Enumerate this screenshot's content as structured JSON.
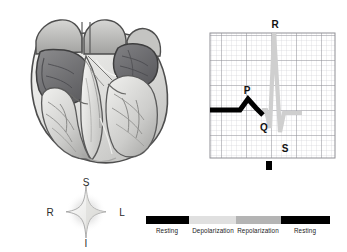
{
  "figure": {
    "background_color": "#ffffff"
  },
  "heart_illustration": {
    "name": "heart-cross-section",
    "description": "Grayscale anatomical cutaway of the heart showing atria, ventricles and trabeculae",
    "palette": {
      "outline": "#4a4a4a",
      "muscle_light": "#e8e8e6",
      "muscle_mid": "#c9c9c7",
      "muscle_dark": "#9a9a98",
      "chamber_dark": "#6f6f70",
      "chamber_darker": "#5a5a5c",
      "highlight": "#f6f6f4"
    }
  },
  "ecg": {
    "grid": {
      "minor_color": "#d2d2d6",
      "major_color": "#8d8d93",
      "minor_step_px": 5,
      "major_every": 5,
      "columns": 25,
      "rows": 25
    },
    "trace": {
      "drawn_color": "#000000",
      "pending_color": "#cfcfcf",
      "drawn_phase": "P wave",
      "pending_phase": "QRS complex"
    },
    "labels": [
      {
        "text": "P",
        "name": "p-wave-label",
        "x": 243,
        "y": 93
      },
      {
        "text": "R",
        "name": "r-wave-label",
        "x": 276,
        "y": 24
      },
      {
        "text": "Q",
        "name": "q-wave-label",
        "x": 263,
        "y": 127
      },
      {
        "text": "S",
        "name": "s-wave-label",
        "x": 285,
        "y": 148
      }
    ],
    "marker": {
      "name": "cursor-marker",
      "color": "#000000",
      "x": 268,
      "y": 160,
      "width": 6,
      "height": 9
    }
  },
  "compass": {
    "name": "orientation-compass",
    "star_fill": "#f2f2f0",
    "star_stroke": "#8a8a8a",
    "glow_color": "#bdbdbd",
    "directions": [
      {
        "text": "S",
        "name": "compass-superior",
        "position": "top"
      },
      {
        "text": "L",
        "name": "compass-left",
        "position": "right"
      },
      {
        "text": "I",
        "name": "compass-inferior",
        "position": "bottom"
      },
      {
        "text": "R",
        "name": "compass-right",
        "position": "left"
      }
    ]
  },
  "legend": {
    "name": "phase-legend",
    "segments": [
      {
        "label": "Resting",
        "color": "#000000",
        "width_px": 43
      },
      {
        "label": "Depolarization",
        "color": "#e0e0e0",
        "width_px": 47
      },
      {
        "label": "Repolarization",
        "color": "#b4b4b4",
        "width_px": 45
      },
      {
        "label": "Resting",
        "color": "#000000",
        "width_px": 49
      }
    ]
  }
}
